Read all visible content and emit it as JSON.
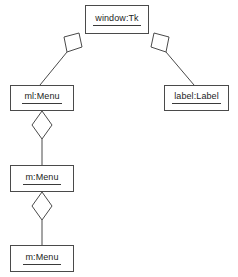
{
  "diagram": {
    "type": "uml-object-diagram",
    "title": "",
    "background_color": "#ffffff",
    "line_color": "#4a4a4a",
    "text_color": "#1c1c1c",
    "nodes": [
      {
        "id": "window",
        "label": "window:Tk",
        "instance_name": "window",
        "class_name": "Tk",
        "x": 85,
        "y": 5,
        "width": 64,
        "height": 29
      },
      {
        "id": "ml_menu",
        "label": "ml:Menu",
        "instance_name": "ml",
        "class_name": "Menu",
        "x": 10,
        "y": 85,
        "width": 64,
        "height": 26
      },
      {
        "id": "label_label",
        "label": "label:Label",
        "instance_name": "label",
        "class_name": "Label",
        "x": 164,
        "y": 85,
        "width": 65,
        "height": 26
      },
      {
        "id": "m_menu_mid",
        "label": "m:Menu",
        "instance_name": "m",
        "class_name": "Menu",
        "x": 10,
        "y": 165,
        "width": 64,
        "height": 27
      },
      {
        "id": "m_menu_bottom",
        "label": "m:Menu",
        "instance_name": "m",
        "class_name": "Menu",
        "x": 10,
        "y": 245,
        "width": 64,
        "height": 27
      }
    ],
    "edges": [
      {
        "id": "edge-window-ml",
        "from": "window",
        "to": "ml_menu",
        "relation": "aggregation",
        "diamond_end": "from"
      },
      {
        "id": "edge-window-label",
        "from": "window",
        "to": "label_label",
        "relation": "aggregation",
        "diamond_end": "from"
      },
      {
        "id": "edge-ml-m",
        "from": "ml_menu",
        "to": "m_menu_mid",
        "relation": "aggregation",
        "diamond_end": "from"
      },
      {
        "id": "edge-m-m",
        "from": "m_menu_mid",
        "to": "m_menu_bottom",
        "relation": "aggregation",
        "diamond_end": "from"
      }
    ]
  }
}
